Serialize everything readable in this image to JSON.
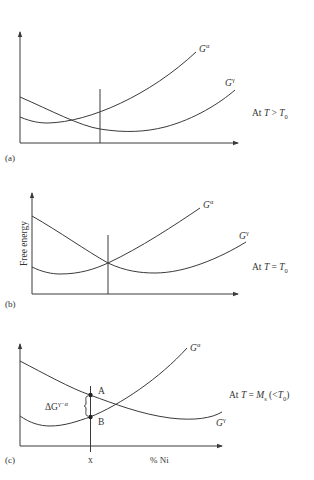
{
  "figure": {
    "y_axis_label": "Free energy",
    "x_axis_label": "% Ni",
    "panels": [
      {
        "id": "a",
        "tag": "(a)",
        "condition_prefix": "At ",
        "condition_var": "T",
        "condition_op": " > ",
        "condition_rhs": "T",
        "condition_rhs_sub": "0",
        "curves": [
          {
            "name": "G-alpha",
            "label_base": "G",
            "label_sup": "α"
          },
          {
            "name": "G-gamma",
            "label_base": "G",
            "label_sup": "γ"
          }
        ]
      },
      {
        "id": "b",
        "tag": "(b)",
        "condition_prefix": "At ",
        "condition_var": "T",
        "condition_op": " = ",
        "condition_rhs": "T",
        "condition_rhs_sub": "0",
        "curves": [
          {
            "name": "G-alpha",
            "label_base": "G",
            "label_sup": "α"
          },
          {
            "name": "G-gamma",
            "label_base": "G",
            "label_sup": "γ"
          }
        ]
      },
      {
        "id": "c",
        "tag": "(c)",
        "condition_prefix": "At ",
        "condition_var": "T",
        "condition_op": " = ",
        "condition_rhs": "M",
        "condition_rhs_sub": "s",
        "condition_suffix_open": " (<",
        "condition_suffix_T": "T",
        "condition_suffix_sub": "0",
        "condition_suffix_close": ")",
        "curves": [
          {
            "name": "G-alpha",
            "label_base": "G",
            "label_sup": "α"
          },
          {
            "name": "G-gamma",
            "label_base": "G",
            "label_sup": "γ"
          }
        ],
        "point_a": "A",
        "point_b": "B",
        "delta_label_base": "ΔG",
        "delta_label_sup": "γ−α",
        "composition_marker": "x"
      }
    ]
  }
}
